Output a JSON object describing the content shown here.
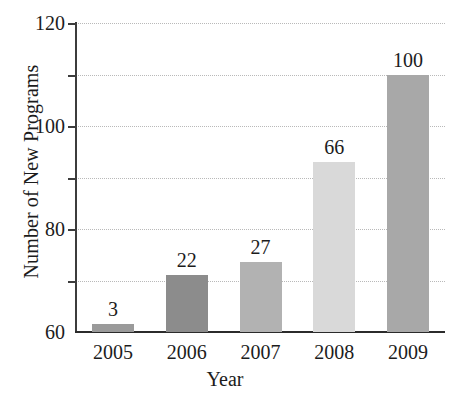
{
  "chart_data": {
    "type": "bar",
    "title": "",
    "xlabel": "Year",
    "ylabel": "Number of New Programs",
    "categories": [
      "2005",
      "2006",
      "2007",
      "2008",
      "2009"
    ],
    "values": [
      3,
      22,
      27,
      66,
      100
    ],
    "value_labels": [
      "3",
      "22",
      "27",
      "66",
      "100"
    ],
    "bar_colors": [
      "#9a9a9a",
      "#8c8c8c",
      "#b2b2b2",
      "#d9d9d9",
      "#a8a8a8"
    ],
    "ylim": [
      0,
      120
    ],
    "ytick_values": [
      0,
      20,
      40,
      60,
      80,
      100,
      120
    ],
    "ytick_labels": [
      "0",
      "20",
      "40",
      "60",
      "80",
      "100",
      "120"
    ],
    "ytick_labels_shown": [
      "20",
      "40",
      "60",
      "80",
      "100",
      "120"
    ],
    "grid": true,
    "grid_axis": "y",
    "grid_style": "dotted",
    "grid_color": "#b9b9b9",
    "legend": "none",
    "axis_color": "#3c3c3c",
    "text_color": "#1c1c1c",
    "background": "#ffffff"
  },
  "axes": {
    "y_title": "Number of New Programs",
    "x_title": "Year"
  }
}
